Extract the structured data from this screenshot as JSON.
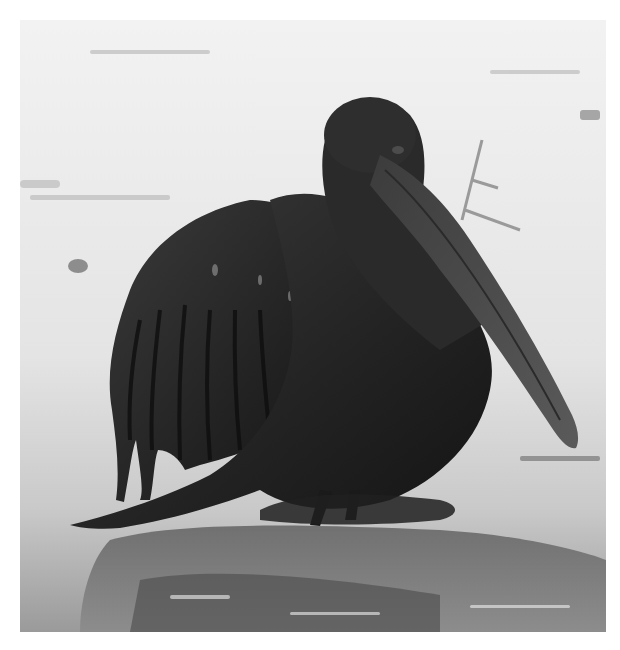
{
  "image": {
    "subject": "oil-covered pelican on a wet shoreline",
    "style": "black-and-white photograph",
    "palette": {
      "background": "#ffffff",
      "sky_water_light": "#ececec",
      "water_mid": "#b8b8b8",
      "oil_dark": "#1c1c1c",
      "oil_mid": "#3a3a3a",
      "bill": "#444444"
    }
  }
}
